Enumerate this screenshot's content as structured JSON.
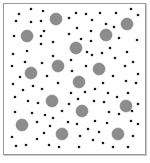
{
  "diagram": {
    "type": "particle-scatter",
    "colors": {
      "background": "#ffffff",
      "border": "#9a9a9a",
      "small_particle": "#1a1a1a",
      "large_particle": "#8c8c8c",
      "large_particle_edge": "#7a7a7a"
    },
    "frame": {
      "x": 3,
      "y": 3,
      "width": 141,
      "height": 150
    },
    "small_radius": 1.3,
    "large_radius": 6,
    "large_particles": [
      [
        56,
        19
      ],
      [
        127,
        24
      ],
      [
        27,
        36
      ],
      [
        106,
        35
      ],
      [
        76,
        48
      ],
      [
        31,
        73
      ],
      [
        58,
        66
      ],
      [
        99,
        69
      ],
      [
        79,
        82
      ],
      [
        52,
        101
      ],
      [
        82,
        111
      ],
      [
        126,
        106
      ],
      [
        22,
        125
      ],
      [
        62,
        134
      ],
      [
        118,
        134
      ]
    ],
    "small_particles": [
      [
        31,
        9
      ],
      [
        43,
        11
      ],
      [
        19,
        14
      ],
      [
        16,
        21
      ],
      [
        31,
        22
      ],
      [
        41,
        21
      ],
      [
        69,
        18
      ],
      [
        76,
        13
      ],
      [
        86,
        14
      ],
      [
        100,
        13
      ],
      [
        116,
        13
      ],
      [
        131,
        9
      ],
      [
        138,
        15
      ],
      [
        92,
        20
      ],
      [
        106,
        24
      ],
      [
        114,
        27
      ],
      [
        77,
        28
      ],
      [
        91,
        31
      ],
      [
        44,
        31
      ],
      [
        14,
        36
      ],
      [
        41,
        36
      ],
      [
        69,
        34
      ],
      [
        81,
        39
      ],
      [
        91,
        41
      ],
      [
        119,
        38
      ],
      [
        137,
        40
      ],
      [
        41,
        44
      ],
      [
        53,
        42
      ],
      [
        110,
        48
      ],
      [
        27,
        51
      ],
      [
        87,
        52
      ],
      [
        102,
        53
      ],
      [
        127,
        52
      ],
      [
        13,
        54
      ],
      [
        53,
        56
      ],
      [
        71,
        60
      ],
      [
        92,
        55
      ],
      [
        115,
        58
      ],
      [
        12,
        66
      ],
      [
        25,
        62
      ],
      [
        42,
        63
      ],
      [
        72,
        71
      ],
      [
        86,
        66
      ],
      [
        125,
        66
      ],
      [
        133,
        62
      ],
      [
        20,
        77
      ],
      [
        47,
        76
      ],
      [
        113,
        76
      ],
      [
        126,
        81
      ],
      [
        138,
        74
      ],
      [
        13,
        84
      ],
      [
        33,
        86
      ],
      [
        42,
        89
      ],
      [
        58,
        83
      ],
      [
        103,
        83
      ],
      [
        136,
        83
      ],
      [
        23,
        90
      ],
      [
        71,
        93
      ],
      [
        85,
        92
      ],
      [
        95,
        89
      ],
      [
        108,
        93
      ],
      [
        117,
        97
      ],
      [
        128,
        93
      ],
      [
        15,
        97
      ],
      [
        28,
        101
      ],
      [
        38,
        103
      ],
      [
        78,
        99
      ],
      [
        94,
        101
      ],
      [
        104,
        102
      ],
      [
        69,
        104
      ],
      [
        138,
        104
      ],
      [
        15,
        112
      ],
      [
        32,
        113
      ],
      [
        45,
        115
      ],
      [
        53,
        118
      ],
      [
        62,
        111
      ],
      [
        109,
        112
      ],
      [
        119,
        114
      ],
      [
        132,
        111
      ],
      [
        37,
        122
      ],
      [
        50,
        126
      ],
      [
        68,
        122
      ],
      [
        77,
        124
      ],
      [
        95,
        121
      ],
      [
        107,
        123
      ],
      [
        131,
        121
      ],
      [
        138,
        124
      ],
      [
        44,
        133
      ],
      [
        88,
        129
      ],
      [
        99,
        132
      ],
      [
        80,
        136
      ],
      [
        12,
        137
      ],
      [
        37,
        139
      ],
      [
        133,
        136
      ],
      [
        16,
        146
      ],
      [
        26,
        145
      ],
      [
        49,
        145
      ],
      [
        59,
        147
      ],
      [
        79,
        147
      ],
      [
        93,
        140
      ],
      [
        103,
        143
      ],
      [
        113,
        147
      ],
      [
        128,
        147
      ]
    ]
  }
}
